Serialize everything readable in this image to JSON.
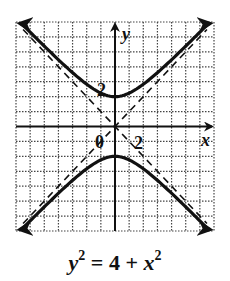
{
  "chart_data": {
    "type": "line",
    "title": "",
    "caption": "y^2 = 4 + x^2",
    "xlabel": "x",
    "ylabel": "y",
    "xlim": [
      -7,
      7
    ],
    "ylim": [
      -7,
      7
    ],
    "grid": true,
    "grid_style": "dotted",
    "tick_labels": {
      "x": [
        "2"
      ],
      "y": [
        "2"
      ],
      "origin": "0"
    },
    "series": [
      {
        "name": "upper branch",
        "equation": "y = sqrt(4 + x^2)",
        "style": "solid",
        "vertex": [
          0,
          2
        ],
        "arrows": "both ends"
      },
      {
        "name": "lower branch",
        "equation": "y = -sqrt(4 + x^2)",
        "style": "solid",
        "vertex": [
          0,
          -2
        ],
        "arrows": "both ends"
      },
      {
        "name": "asymptote 1",
        "equation": "y = x",
        "style": "dashed"
      },
      {
        "name": "asymptote 2",
        "equation": "y = -x",
        "style": "dashed"
      }
    ]
  },
  "labels": {
    "x_axis": "x",
    "y_axis": "y",
    "x_tick": "2",
    "y_tick": "2",
    "origin": "0"
  },
  "equation": {
    "lhs_var": "y",
    "lhs_exp": "2",
    "middle": " = 4 + ",
    "rhs_var": "x",
    "rhs_exp": "2"
  }
}
